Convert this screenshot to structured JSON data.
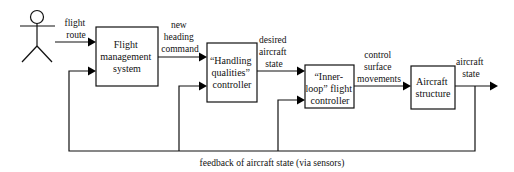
{
  "diagram": {
    "actor": {
      "name": "pilot",
      "icon": "stick-figure"
    },
    "blocks": [
      {
        "id": "fms",
        "lines": [
          "Flight",
          "management",
          "system"
        ]
      },
      {
        "id": "hq",
        "lines": [
          "“Handling",
          "qualities”",
          "controller"
        ]
      },
      {
        "id": "inner",
        "lines": [
          "“Inner-",
          "loop” flight",
          "controller"
        ]
      },
      {
        "id": "structure",
        "lines": [
          "Aircraft",
          "structure"
        ]
      }
    ],
    "signals": [
      {
        "id": "flight-route",
        "lines": [
          "flight",
          "route"
        ]
      },
      {
        "id": "new-heading",
        "lines": [
          "new",
          "heading",
          "command"
        ]
      },
      {
        "id": "desired-state",
        "lines": [
          "desired",
          "aircraft",
          "state"
        ]
      },
      {
        "id": "control-surface",
        "lines": [
          "control",
          "surface",
          "movements"
        ]
      },
      {
        "id": "aircraft-state",
        "lines": [
          "aircraft",
          "state"
        ]
      }
    ],
    "feedback_label": "feedback of aircraft state (via sensors)"
  }
}
